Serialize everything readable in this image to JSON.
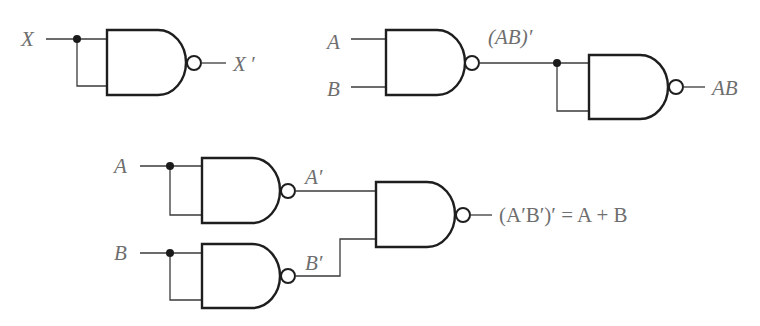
{
  "diagram": {
    "colors": {
      "wire": "#3a3a3a",
      "gate": "#1e1e1e",
      "label": "#6e6e6e",
      "background": "#ffffff"
    },
    "not_circuit": {
      "input_label": "X",
      "output_label": "X ′",
      "gate_type": "NAND"
    },
    "and_circuit": {
      "input_a_label": "A",
      "input_b_label": "B",
      "intermediate_label": "(AB)′",
      "output_label": "AB",
      "gates": [
        "NAND",
        "NAND"
      ]
    },
    "or_circuit": {
      "input_a_label": "A",
      "input_b_label": "B",
      "a_not_label": "A′",
      "b_not_label": "B′",
      "output_label": "(A′B′)′ = A + B",
      "gates": [
        "NAND",
        "NAND",
        "NAND"
      ]
    }
  }
}
